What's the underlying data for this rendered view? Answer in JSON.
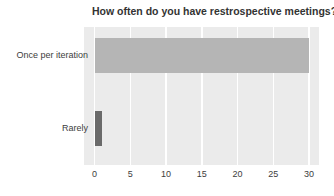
{
  "chart_data": {
    "type": "bar",
    "orientation": "horizontal",
    "title": "How often do you have restrospective meetings?",
    "categories": [
      "Once per iteration",
      "Rarely"
    ],
    "values": [
      30,
      1
    ],
    "xlabel": "",
    "ylabel": "",
    "xlim": [
      0,
      31.5
    ],
    "xticks": [
      0,
      5,
      10,
      15,
      20,
      25,
      30
    ],
    "grid": "vertical white major gridlines on gray panel",
    "legend": "none",
    "panel_background": "#ebebeb",
    "bar_colors": [
      "#b5b5b5",
      "#6a6a6a"
    ],
    "title_color": "#333333",
    "axis_text_color": "#3d3d3d"
  }
}
